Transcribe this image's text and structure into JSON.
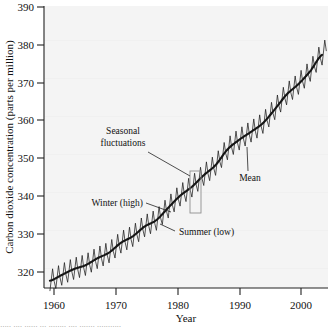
{
  "chart_data": {
    "type": "line",
    "title": "",
    "xlabel": "Year",
    "ylabel": "Carbon dioxide concentration (parts per million)",
    "xlim": [
      1957,
      2005
    ],
    "ylim": [
      313,
      391
    ],
    "xticks": [
      1960,
      1970,
      1980,
      1990,
      2000
    ],
    "xtick_labels": [
      "1960",
      "1970",
      "1980",
      "1990",
      "2000"
    ],
    "yticks": [
      320,
      330,
      340,
      350,
      360,
      370,
      380,
      390
    ],
    "ytick_labels": [
      "320",
      "330",
      "340",
      "350",
      "360",
      "370",
      "380",
      "390"
    ],
    "grid": false,
    "legend": "none",
    "series": [
      {
        "name": "Mean",
        "description": "smooth monotonically increasing trend of atmospheric CO2",
        "x": [
          1958,
          1960,
          1962,
          1964,
          1966,
          1968,
          1970,
          1972,
          1974,
          1976,
          1978,
          1980,
          1982,
          1984,
          1986,
          1988,
          1990,
          1992,
          1994,
          1996,
          1998,
          2000,
          2002,
          2004
        ],
        "values": [
          315.0,
          316.6,
          318.2,
          319.3,
          321.2,
          322.8,
          325.5,
          327.3,
          330.0,
          331.8,
          335.2,
          338.5,
          341.0,
          344.2,
          347.0,
          351.3,
          354.0,
          356.2,
          358.6,
          362.4,
          366.5,
          369.4,
          373.0,
          377.5
        ]
      },
      {
        "name": "Seasonal fluctuations",
        "description": "sawtooth oscillation about the mean, amplitude about 3 ppm, one cycle per year; winter peak (high) and summer trough (low)",
        "amplitude_ppm": 3.0,
        "period_years": 1
      }
    ],
    "annotations": [
      {
        "label": "Seasonal\nfluctuations",
        "line1": "Seasonal",
        "line2": "fluctuations",
        "points_to": "highlight box around one annual cycle near 1983"
      },
      {
        "label": "Mean",
        "points_to": "smooth trend curve near 1993"
      },
      {
        "label": "Winter (high)",
        "points_to": "oscillation peak near 1981"
      },
      {
        "label": "Summer (low)",
        "points_to": "oscillation trough near 1983"
      }
    ]
  },
  "axes": {
    "y_title": "Carbon dioxide concentration (parts per million)",
    "x_title": "Year",
    "y_labels": [
      "390",
      "380",
      "370",
      "360",
      "350",
      "340",
      "330",
      "320"
    ],
    "x_labels": [
      "1960",
      "1970",
      "1980",
      "1990",
      "2000"
    ]
  },
  "annotations": {
    "seasonal_line1": "Seasonal",
    "seasonal_line2": "fluctuations",
    "mean": "Mean",
    "winter": "Winter (high)",
    "summer": "Summer (low)"
  },
  "colors": {
    "plot_background": "#f4f4f4",
    "axis": "#222222",
    "data_line": "#1c1c1c",
    "mean_line": "#151515",
    "annotation_text": "#111111",
    "highlight_box": "#8a8a8a"
  },
  "caption_strip": {
    "text": "∙∙∙∙∙ ∙∙∙∙ ∙∙∙∙∙∙ ∙∙∙ ∙∙∙∙∙∙∙∙ ∙∙∙∙ ∙∙∙∙∙∙∙ ∙∙∙∙∙∙∙∙∙∙∙"
  }
}
